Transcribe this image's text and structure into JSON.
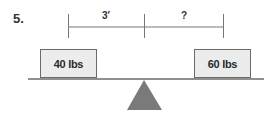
{
  "problem": {
    "number": "5.",
    "dimensions": {
      "left_distance": "3′",
      "right_distance": "?"
    },
    "weights": {
      "left": "40 lbs",
      "right": "60 lbs"
    },
    "colors": {
      "box_fill": "#ececec",
      "box_border": "#6b6b6b",
      "fulcrum": "#7a7a7a",
      "lines": "#6b6b6b"
    }
  }
}
